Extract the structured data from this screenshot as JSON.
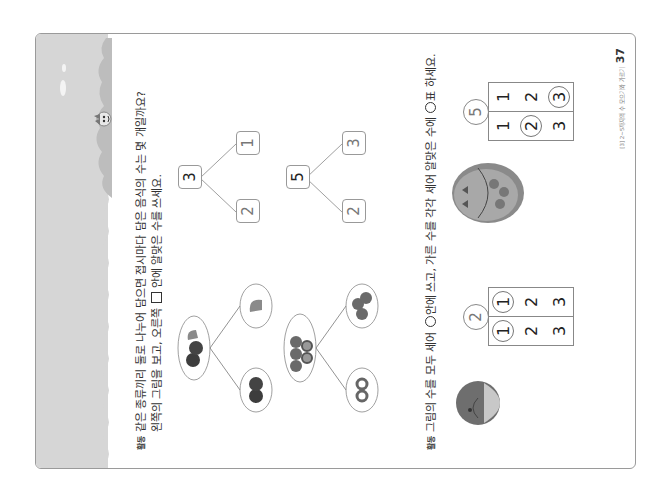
{
  "page": {
    "orientation": "rotated-90-ccw",
    "band_color": "#d6d6d6",
    "band_accent_color": "#bdbdbd",
    "footer": {
      "chapter_label": "[3] 2~5까지의 수 모으기와 가르기",
      "page_number": "37"
    }
  },
  "question1": {
    "marker": "활동",
    "line1": "같은 종류끼리 둘로 나누어 담으면 접시마다 담은 음식의 수는 몇 개일까요?",
    "line2_before_box": "왼쪽의 그림을 보고, 오른쪽",
    "line2_after_box": "안에 알맞은 수를 쓰세요.",
    "items": [
      {
        "picture": {
          "whole": "2 apples + 1 persimmon",
          "part_a": "1 persimmon",
          "part_b": "2 apples"
        },
        "diagram": {
          "whole": "3",
          "part_top": "2",
          "part_bottom": "1"
        }
      },
      {
        "picture": {
          "whole": "3 berries + 2 donuts",
          "part_a": "3 berries",
          "part_b": "2 donuts"
        },
        "diagram": {
          "whole": "5",
          "part_top": "2",
          "part_bottom": "3"
        }
      }
    ]
  },
  "question2": {
    "marker": "활동",
    "text_before_circle": "그림의 수를 모두 세어",
    "text_after_circle": "안에 쓰고, 가른 수를 각각 세어 알맞은 수에",
    "text_after_circle2": "표 하세요.",
    "items": [
      {
        "picture": "octopus-jellyfish",
        "total": "2",
        "columns": [
          {
            "values": [
              "1",
              "2",
              "3"
            ],
            "circled": "1"
          },
          {
            "values": [
              "1",
              "2",
              "3"
            ],
            "circled": "1"
          }
        ]
      },
      {
        "picture": "plate-with-fish-and-cookies",
        "total": "5",
        "columns": [
          {
            "values": [
              "1",
              "2",
              "3"
            ],
            "circled": "2"
          },
          {
            "values": [
              "1",
              "2",
              "3"
            ],
            "circled": "3"
          }
        ]
      }
    ]
  }
}
